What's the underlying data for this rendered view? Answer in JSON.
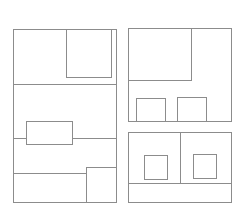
{
  "diagram": {
    "type": "wireframe-layout",
    "stroke_color": "#8c8c8c",
    "background": "#ffffff",
    "panels": [
      {
        "name": "left-panel",
        "shapes": [
          {
            "kind": "rect",
            "name": "left-panel-frame",
            "x": 13,
            "y": 29,
            "w": 104,
            "h": 174
          },
          {
            "kind": "rect",
            "name": "left-top-inner-box",
            "x": 66,
            "y": 29,
            "w": 46,
            "h": 49
          },
          {
            "kind": "hline",
            "name": "left-divider-top",
            "x": 13,
            "y": 84,
            "w": 104
          },
          {
            "kind": "hline",
            "name": "left-divider-middle-a",
            "x": 13,
            "y": 138,
            "w": 13
          },
          {
            "kind": "rect",
            "name": "left-middle-box",
            "x": 26,
            "y": 121,
            "w": 47,
            "h": 24
          },
          {
            "kind": "hline",
            "name": "left-divider-middle-b",
            "x": 73,
            "y": 138,
            "w": 44
          },
          {
            "kind": "hline",
            "name": "left-divider-bottom",
            "x": 13,
            "y": 173,
            "w": 73
          },
          {
            "kind": "rect",
            "name": "left-bottom-right-box",
            "x": 86,
            "y": 167,
            "w": 31,
            "h": 36
          }
        ]
      },
      {
        "name": "right-top-panel",
        "shapes": [
          {
            "kind": "rect",
            "name": "right-top-frame",
            "x": 128,
            "y": 28,
            "w": 104,
            "h": 94
          },
          {
            "kind": "rect",
            "name": "right-top-inner-box",
            "x": 128,
            "y": 28,
            "w": 64,
            "h": 53
          },
          {
            "kind": "rect",
            "name": "right-top-small-box-1",
            "x": 136,
            "y": 98,
            "w": 30,
            "h": 24
          },
          {
            "kind": "rect",
            "name": "right-top-small-box-2",
            "x": 177,
            "y": 97,
            "w": 30,
            "h": 25
          }
        ]
      },
      {
        "name": "right-bottom-panel",
        "shapes": [
          {
            "kind": "rect",
            "name": "right-bottom-frame",
            "x": 128,
            "y": 132,
            "w": 104,
            "h": 71
          },
          {
            "kind": "vline",
            "name": "right-bottom-divider-v",
            "x": 180,
            "y": 132,
            "h": 51
          },
          {
            "kind": "hline",
            "name": "right-bottom-divider-h",
            "x": 128,
            "y": 183,
            "w": 104
          },
          {
            "kind": "rect",
            "name": "right-bottom-square-1",
            "x": 144,
            "y": 155,
            "w": 24,
            "h": 25
          },
          {
            "kind": "rect",
            "name": "right-bottom-square-2",
            "x": 193,
            "y": 154,
            "w": 24,
            "h": 25
          }
        ]
      }
    ]
  }
}
